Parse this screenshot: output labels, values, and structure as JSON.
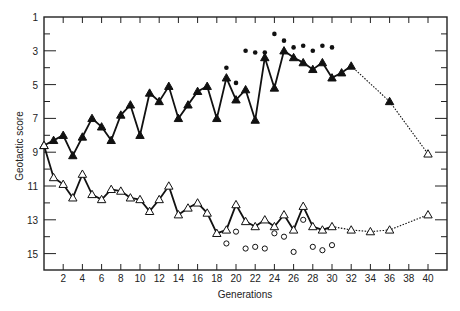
{
  "chart_data": {
    "type": "line",
    "title": "",
    "xlabel": "Generations",
    "ylabel": "Geotactic score",
    "xlim": [
      0,
      42
    ],
    "ylim": [
      16,
      1
    ],
    "y_inverted": true,
    "x_ticks": [
      2,
      4,
      6,
      8,
      10,
      12,
      14,
      16,
      18,
      20,
      22,
      24,
      26,
      28,
      30,
      32,
      34,
      36,
      38,
      40
    ],
    "y_ticks_labeled": [
      1,
      3,
      5,
      7,
      9,
      11,
      13,
      15
    ],
    "y_ticks_minor": [
      2,
      4,
      6,
      8,
      10,
      12,
      14,
      16
    ],
    "grid": false,
    "legend": "none",
    "series": [
      {
        "name": "Upward selected line",
        "marker": "filled-triangle",
        "line": "solid",
        "x": [
          0,
          1,
          2,
          3,
          4,
          5,
          6,
          7,
          8,
          9,
          10,
          11,
          12,
          13,
          14,
          15,
          16,
          17,
          18,
          19,
          20,
          21,
          22,
          23,
          24,
          25,
          26,
          27,
          28,
          29,
          30,
          31,
          32
        ],
        "values": [
          8.6,
          8.3,
          8.0,
          9.2,
          8.1,
          7.0,
          7.5,
          8.3,
          6.8,
          6.2,
          8.0,
          5.5,
          6.0,
          5.1,
          7.0,
          6.2,
          5.4,
          5.1,
          7.0,
          4.6,
          5.9,
          5.3,
          7.1,
          3.4,
          5.2,
          3.0,
          3.4,
          3.7,
          4.1,
          3.7,
          4.6,
          4.3,
          3.9
        ]
      },
      {
        "name": "Upward selected line (extension)",
        "marker": "filled-triangle",
        "line": "dotted",
        "x": [
          32,
          36
        ],
        "values": [
          3.9,
          6.0
        ]
      },
      {
        "name": "Upward selected line (relaxed)",
        "marker": "open-triangle",
        "line": "dotted",
        "x": [
          36,
          40
        ],
        "values": [
          6.0,
          9.1
        ]
      },
      {
        "name": "Downward selected line",
        "marker": "open-triangle",
        "line": "solid",
        "x": [
          0,
          1,
          2,
          3,
          4,
          5,
          6,
          7,
          8,
          9,
          10,
          11,
          12,
          13,
          14,
          15,
          16,
          17,
          18,
          19,
          20,
          21,
          22,
          23,
          24,
          25,
          26,
          27,
          28,
          29,
          30
        ],
        "values": [
          8.6,
          10.5,
          10.9,
          11.7,
          10.3,
          11.5,
          11.8,
          11.2,
          11.3,
          11.7,
          11.8,
          12.5,
          11.8,
          11.0,
          12.7,
          12.3,
          12.0,
          12.6,
          13.8,
          13.6,
          12.1,
          13.1,
          13.4,
          13.0,
          13.4,
          12.7,
          13.6,
          12.2,
          13.4,
          13.6,
          13.4
        ]
      },
      {
        "name": "Downward selected line (extension)",
        "marker": "open-triangle",
        "line": "dotted",
        "x": [
          30,
          32,
          34,
          36,
          40
        ],
        "values": [
          13.4,
          13.6,
          13.7,
          13.6,
          12.7
        ]
      },
      {
        "name": "Upward points",
        "marker": "filled-circle",
        "line": "none",
        "x": [
          19,
          20,
          21,
          22,
          23,
          24,
          25,
          26,
          27,
          28,
          29,
          30
        ],
        "values": [
          4.0,
          4.9,
          3.0,
          3.1,
          3.1,
          2.0,
          2.4,
          2.8,
          2.7,
          3.0,
          2.7,
          2.8
        ]
      },
      {
        "name": "Downward points",
        "marker": "open-circle",
        "line": "none",
        "x": [
          19,
          20,
          21,
          22,
          23,
          24,
          25,
          26,
          27,
          28,
          29,
          30
        ],
        "values": [
          14.4,
          13.7,
          14.7,
          14.6,
          14.7,
          13.8,
          14.0,
          14.9,
          13.0,
          14.6,
          14.8,
          14.5
        ]
      }
    ]
  }
}
